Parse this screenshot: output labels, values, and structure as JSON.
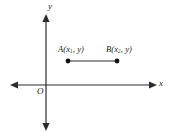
{
  "figure": {
    "background_color": "#ffffff",
    "stroke_color": "#2b2b2b"
  },
  "axes": {
    "y_axis_label": "y",
    "x_axis_label": "x",
    "origin_label": "O",
    "y_axis_x_px": 46,
    "x_axis_y_px": 85,
    "x_axis_start_px": 10,
    "x_axis_end_px": 157,
    "y_axis_top_px": 14,
    "y_axis_bottom_px": 131
  },
  "points": [
    {
      "id": "A",
      "label_letter": "A",
      "label_open": "(",
      "label_var": "x",
      "label_sub": "1",
      "label_comma": ", ",
      "label_y": "y",
      "label_close": ")",
      "label_full": "A(x1, y)",
      "cx_px": 68,
      "cy_px": 61,
      "radius_px": 2.4
    },
    {
      "id": "B",
      "label_letter": "B",
      "label_open": "(",
      "label_var": "x",
      "label_sub": "2",
      "label_comma": ", ",
      "label_y": "y",
      "label_close": ")",
      "label_full": "B(x2, y)",
      "cx_px": 117,
      "cy_px": 61,
      "radius_px": 2.4
    }
  ],
  "segment": {
    "name": "AB",
    "from_px": 68,
    "to_px": 117,
    "y_px": 61
  }
}
